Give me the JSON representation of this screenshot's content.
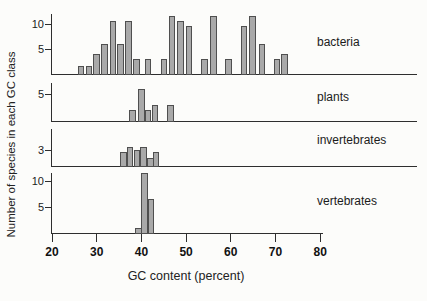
{
  "figure": {
    "background": "#fcfcfa",
    "axis_color": "#2e2e2e",
    "bar_fill": "#a9a9a9",
    "bar_border": "#4f4f4f",
    "text_color": "#1b1b1b"
  },
  "chart_data": {
    "type": "bar",
    "title": "",
    "xlabel": "GC content (percent)",
    "ylabel": "Number of species in each GC class",
    "grid": false,
    "legend": "none",
    "x_axis": {
      "min": 20,
      "max": 80,
      "ticks": [
        20,
        30,
        40,
        50,
        60,
        70,
        80
      ]
    },
    "panels": [
      {
        "name": "bacteria",
        "label": "bacteria",
        "yticks": [
          5,
          10
        ],
        "ylim": [
          0,
          12
        ],
        "bars": [
          {
            "gc": 26.5,
            "n": 1.5
          },
          {
            "gc": 28.3,
            "n": 1.5
          },
          {
            "gc": 30.0,
            "n": 4
          },
          {
            "gc": 31.8,
            "n": 6
          },
          {
            "gc": 33.6,
            "n": 10.5
          },
          {
            "gc": 35.3,
            "n": 6
          },
          {
            "gc": 37.1,
            "n": 10.5
          },
          {
            "gc": 38.9,
            "n": 3
          },
          {
            "gc": 41.5,
            "n": 3
          },
          {
            "gc": 45.1,
            "n": 3
          },
          {
            "gc": 46.9,
            "n": 11.5
          },
          {
            "gc": 48.7,
            "n": 10.5
          },
          {
            "gc": 50.7,
            "n": 9.5
          },
          {
            "gc": 54.1,
            "n": 3
          },
          {
            "gc": 56.1,
            "n": 11.5
          },
          {
            "gc": 59.5,
            "n": 3
          },
          {
            "gc": 63.0,
            "n": 9.5
          },
          {
            "gc": 64.8,
            "n": 11.5
          },
          {
            "gc": 67.0,
            "n": 6
          },
          {
            "gc": 70.3,
            "n": 3
          },
          {
            "gc": 72.0,
            "n": 4
          }
        ]
      },
      {
        "name": "plants",
        "label": "plants",
        "yticks": [
          5
        ],
        "ylim": [
          0,
          7
        ],
        "bars": [
          {
            "gc": 38.0,
            "n": 2
          },
          {
            "gc": 40.0,
            "n": 6
          },
          {
            "gc": 41.5,
            "n": 2
          },
          {
            "gc": 43.0,
            "n": 3
          },
          {
            "gc": 46.5,
            "n": 3
          }
        ]
      },
      {
        "name": "invertebrates",
        "label": "invertebrates",
        "yticks": [
          3
        ],
        "ylim": [
          0,
          4
        ],
        "bars": [
          {
            "gc": 36.0,
            "n": 2.5
          },
          {
            "gc": 37.5,
            "n": 3.5
          },
          {
            "gc": 39.0,
            "n": 3
          },
          {
            "gc": 40.5,
            "n": 3.5
          },
          {
            "gc": 42.0,
            "n": 1.5
          },
          {
            "gc": 43.3,
            "n": 2.5
          }
        ]
      },
      {
        "name": "vertebrates",
        "label": "vertebrates",
        "yticks": [
          5,
          10
        ],
        "ylim": [
          0,
          12
        ],
        "bars": [
          {
            "gc": 39.3,
            "n": 1
          },
          {
            "gc": 40.7,
            "n": 11.5
          },
          {
            "gc": 42.2,
            "n": 6.5
          }
        ]
      }
    ]
  }
}
